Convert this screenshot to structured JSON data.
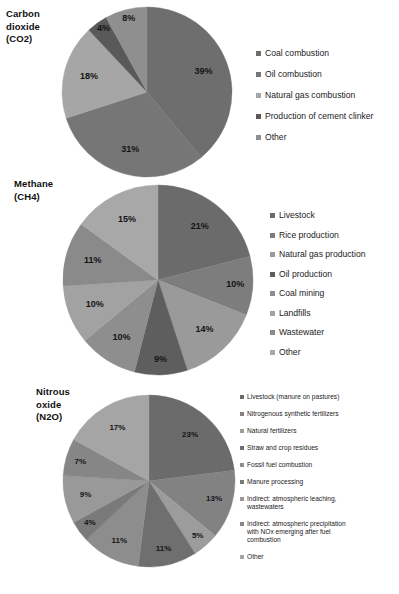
{
  "figure": {
    "background": "#ffffff"
  },
  "palette": {
    "s1": "#6e6e6e",
    "s2": "#8c8c8c",
    "s3": "#a6a6a6",
    "s4": "#595959",
    "s5": "#949494",
    "s6": "#7f7f7f",
    "s7": "#9c9c9c",
    "s8": "#b0b0b0",
    "s9": "#868686",
    "label_color": "#141414"
  },
  "panels": [
    {
      "id": "co2",
      "title": "Carbon\ndioxide\n(CO2)",
      "title_lines": [
        "Carbon",
        "dioxide",
        "(CO2)"
      ],
      "chart_data": {
        "type": "pie",
        "title": "Carbon dioxide (CO2)",
        "categories": [
          "Coal combustion",
          "Oil combustion",
          "Natural gas combustion",
          "Production of cement clinker",
          "Other"
        ],
        "values": [
          39,
          31,
          18,
          4,
          8
        ],
        "labels": [
          "39%",
          "31%",
          "18%",
          "4%",
          "8%"
        ],
        "unit": "%",
        "legend_position": "right",
        "colors": [
          "#6e6e6e",
          "#767676",
          "#a6a6a6",
          "#595959",
          "#8f8f8f"
        ]
      }
    },
    {
      "id": "ch4",
      "title": "Methane\n(CH4)",
      "title_lines": [
        "Methane",
        "(CH4)"
      ],
      "chart_data": {
        "type": "pie",
        "title": "Methane (CH4)",
        "categories": [
          "Livestock",
          "Rice production",
          "Natural gas production",
          "Oil production",
          "Coal mining",
          "Landfills",
          "Wastewater",
          "Other"
        ],
        "values": [
          21,
          10,
          14,
          9,
          10,
          10,
          11,
          15
        ],
        "labels": [
          "21%",
          "10%",
          "14%",
          "9%",
          "10%",
          "10%",
          "11%",
          "15%"
        ],
        "unit": "%",
        "legend_position": "right",
        "colors": [
          "#6b6b6b",
          "#7d7d7d",
          "#9a9a9a",
          "#5e5e5e",
          "#8e8e8e",
          "#a2a2a2",
          "#8a8a8a",
          "#a8a8a8"
        ]
      }
    },
    {
      "id": "n2o",
      "title": "Nitrous\noxide\n(N2O)",
      "title_lines": [
        "Nitrous",
        "oxide",
        "(N2O)"
      ],
      "chart_data": {
        "type": "pie",
        "title": "Nitrous oxide (N2O)",
        "categories": [
          "Livestock (manure on pastures)",
          "Nitrogenous synthetic fertilizers",
          "Natural fertilizers",
          "Straw and crop residues",
          "Fossil fuel combustion",
          "Manure processing",
          "Indirect: atmospheric leaching, wastewaters",
          "Indirect: atmospheric precipitation with NOx emerging after fuel combustion",
          "Other"
        ],
        "values": [
          23,
          13,
          5,
          11,
          11,
          4,
          9,
          7,
          17
        ],
        "labels": [
          "23%",
          "13%",
          "5%",
          "11%",
          "11%",
          "4%",
          "9%",
          "7%",
          "17%"
        ],
        "unit": "%",
        "legend_position": "right",
        "colors": [
          "#6b6b6b",
          "#828282",
          "#9c9c9c",
          "#6f6f6f",
          "#8d8d8d",
          "#7a7a7a",
          "#999999",
          "#868686",
          "#a5a5a5"
        ]
      }
    }
  ],
  "legends": {
    "co2": [
      {
        "label": "Coal combustion",
        "color": "#6e6e6e"
      },
      {
        "label": "Oil combustion",
        "color": "#767676"
      },
      {
        "label": "Natural gas combustion",
        "color": "#a6a6a6"
      },
      {
        "label": "Production of cement clinker",
        "color": "#595959"
      },
      {
        "label": "Other",
        "color": "#8f8f8f"
      }
    ],
    "ch4": [
      {
        "label": "Livestock",
        "color": "#6b6b6b"
      },
      {
        "label": "Rice production",
        "color": "#7d7d7d"
      },
      {
        "label": "Natural gas production",
        "color": "#9a9a9a"
      },
      {
        "label": "Oil production",
        "color": "#5e5e5e"
      },
      {
        "label": "Coal mining",
        "color": "#8e8e8e"
      },
      {
        "label": "Landfills",
        "color": "#a2a2a2"
      },
      {
        "label": "Wastewater",
        "color": "#8a8a8a"
      },
      {
        "label": "Other",
        "color": "#a8a8a8"
      }
    ],
    "n2o": [
      {
        "label": "Livestock (manure on pastures)",
        "color": "#6b6b6b"
      },
      {
        "label": "Nitrogenous synthetic fertilizers",
        "color": "#828282"
      },
      {
        "label": "Natural fertilizers",
        "color": "#9c9c9c"
      },
      {
        "label": "Straw and crop residues",
        "color": "#6f6f6f"
      },
      {
        "label": "Fossil fuel combustion",
        "color": "#8d8d8d"
      },
      {
        "label": "Manure processing",
        "color": "#7a7a7a"
      },
      {
        "label": "Indirect: atmospheric leaching,\nwastewaters",
        "color": "#999999"
      },
      {
        "label": "Indirect: atmospheric precipitation\nwith NOx emerging after fuel\ncombustion",
        "color": "#868686"
      },
      {
        "label": "Other",
        "color": "#a5a5a5"
      }
    ]
  }
}
